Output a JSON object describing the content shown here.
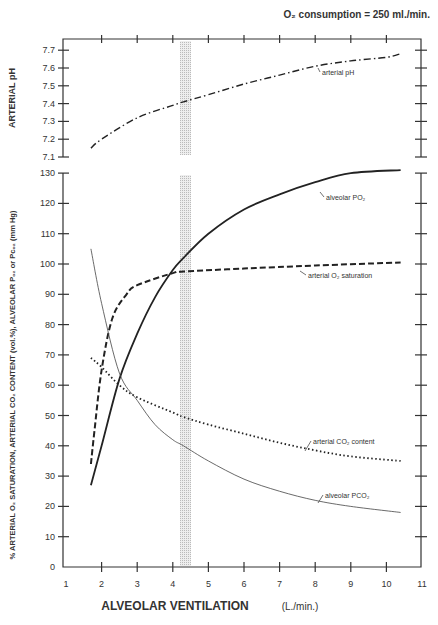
{
  "chart_data": [
    {
      "type": "line",
      "title": "O2 consumption = 250 ml./min.",
      "xlabel": "ALVEOLAR VENTILATION (L./min.)",
      "ylabel": "ARTERIAL pH",
      "ylim": [
        7.1,
        7.7
      ],
      "xlim": [
        1,
        11
      ],
      "yticks": [
        "7.1",
        "7.2",
        "7.3",
        "7.4",
        "7.5",
        "7.6",
        "7.7"
      ],
      "grid": false,
      "series": [
        {
          "name": "arterial pH",
          "style": "dash-dot",
          "x": [
            1.7,
            2,
            3,
            4,
            4.3,
            5,
            6,
            7,
            8,
            9,
            10,
            10.4
          ],
          "values": [
            7.15,
            7.2,
            7.32,
            7.39,
            7.41,
            7.45,
            7.51,
            7.56,
            7.61,
            7.64,
            7.66,
            7.68
          ]
        }
      ],
      "annotations": [
        {
          "text": "normal ventilation band",
          "x": [
            4.3,
            4.6
          ],
          "style": "stippled vertical band"
        }
      ]
    },
    {
      "type": "line",
      "xlabel": "ALVEOLAR VENTILATION (L./min.)",
      "ylabel": "% ARTERIAL O2 SATURATION, ARTERIAL CO2 CONTENT (vol.%), ALVEOLAR PO2 or PCO2 (mm Hg)",
      "xticks": [
        "1",
        "2",
        "3",
        "4",
        "5",
        "6",
        "7",
        "8",
        "9",
        "10",
        "11"
      ],
      "yticks": [
        "0",
        "10",
        "20",
        "30",
        "40",
        "50",
        "60",
        "70",
        "80",
        "90",
        "100",
        "110",
        "120",
        "130"
      ],
      "xlim": [
        1,
        11
      ],
      "ylim": [
        0,
        130
      ],
      "grid": false,
      "series": [
        {
          "name": "alveolar PO2",
          "style": "solid-thick",
          "x": [
            1.7,
            2,
            2.5,
            3,
            3.5,
            4,
            4.3,
            5,
            6,
            7,
            8,
            9,
            10.4
          ],
          "values": [
            27,
            40,
            62,
            77,
            89,
            98,
            102,
            110,
            118,
            123,
            127,
            130,
            131
          ]
        },
        {
          "name": "arterial O2 saturation",
          "style": "dashed",
          "x": [
            1.7,
            1.8,
            2,
            2.3,
            2.7,
            3,
            4,
            4.3,
            6,
            8,
            10.4
          ],
          "values": [
            34,
            45,
            65,
            82,
            90,
            93,
            97,
            97.5,
            98.5,
            99.5,
            100.5
          ]
        },
        {
          "name": "arterial CO2 content",
          "style": "dotted",
          "x": [
            1.7,
            2,
            2.5,
            3,
            4,
            4.3,
            5,
            6,
            7,
            8,
            9,
            10.4
          ],
          "values": [
            69,
            66,
            60,
            56,
            51,
            49.5,
            47,
            44,
            41,
            38.5,
            36.5,
            35
          ]
        },
        {
          "name": "alveolar PCO2",
          "style": "solid-thin",
          "x": [
            1.7,
            2,
            2.5,
            3,
            3.5,
            4,
            4.3,
            5,
            6,
            7,
            8,
            9,
            10.4
          ],
          "values": [
            105,
            87,
            64,
            55,
            47,
            42,
            40,
            35,
            29,
            25,
            22,
            20,
            18
          ]
        }
      ]
    }
  ],
  "labels": {
    "title": "O₂ consumption = 250 ml./min.",
    "ph_axis_title": "ARTERIAL pH",
    "left_axis_title": "% ARTERIAL O₂ SATURATION, ARTERIAL CO₂ CONTENT (vol.%), ALVEOLAR Pₒ₂ or Pᴄₒ₂ (mm Hg)",
    "x_axis_title": "ALVEOLAR VENTILATION",
    "x_axis_units": "(L./min.)",
    "curve_ph": "arterial pH",
    "curve_po2": "alveolar PO₂",
    "curve_sat": "arterial O₂ saturation",
    "curve_co2": "arterial CO₂ content",
    "curve_pco2": "alveolar PCO₂"
  }
}
